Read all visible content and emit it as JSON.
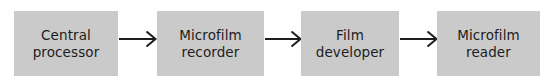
{
  "diagram": {
    "type": "flowchart",
    "orientation": "left-to-right",
    "title": "",
    "canvas": {
      "width": 552,
      "height": 76,
      "background": "#ffffff"
    },
    "style": {
      "node_fill": "#cacaca",
      "node_text_color": "#1d1d1d",
      "arrow_color": "#1d1d1d",
      "arrow_head": "open-v"
    },
    "nodes": [
      {
        "id": "central-processor",
        "line1": "Central",
        "line2": "processor",
        "x": 14,
        "y": 11,
        "width": 104,
        "height": 65
      },
      {
        "id": "microfilm-recorder",
        "line1": "Microfilm",
        "line2": "recorder",
        "x": 157,
        "y": 11,
        "width": 107,
        "height": 65
      },
      {
        "id": "film-developer",
        "line1": "Film",
        "line2": "developer",
        "x": 301,
        "y": 11,
        "width": 98,
        "height": 65
      },
      {
        "id": "microfilm-reader",
        "line1": "Microfilm",
        "line2": "reader",
        "x": 437,
        "y": 11,
        "width": 103,
        "height": 65
      }
    ],
    "connectors": [
      {
        "id": "cp-to-mr",
        "from": "central-processor",
        "to": "microfilm-recorder",
        "x": 119,
        "y": 39,
        "length": 37
      },
      {
        "id": "mr-to-fd",
        "from": "microfilm-recorder",
        "to": "film-developer",
        "x": 265,
        "y": 39,
        "length": 36
      },
      {
        "id": "fd-to-mrd",
        "from": "film-developer",
        "to": "microfilm-reader",
        "x": 400,
        "y": 39,
        "length": 37
      }
    ]
  }
}
